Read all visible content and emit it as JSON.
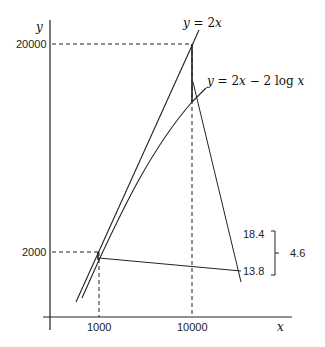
{
  "diagram": {
    "axes": {
      "y_label": "y",
      "x_label": "x",
      "y_ticks": [
        "20000",
        "2000"
      ],
      "x_ticks": [
        "1000",
        "10000"
      ]
    },
    "curves": {
      "linear": {
        "label": "y = 2x",
        "lhs": "y",
        "eq": " = 2",
        "var": "x"
      },
      "log": {
        "label": "y = 2x − 2 log x",
        "lhs": "y",
        "eq": " = 2",
        "var": "x",
        "mid": " − 2 log ",
        "var2": "x"
      }
    },
    "callouts": {
      "upper_value": "18.4",
      "lower_value": "13.8",
      "difference": "4.6"
    },
    "colors": {
      "line": "#222222",
      "text": "#222222",
      "background": "#ffffff"
    }
  }
}
